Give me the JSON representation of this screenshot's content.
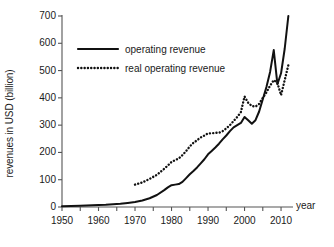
{
  "chart_data": {
    "type": "line",
    "title": "",
    "xlabel": "year",
    "ylabel": "revenues in USD (billion)",
    "xlim": [
      1950,
      2013
    ],
    "ylim": [
      0,
      700
    ],
    "grid": false,
    "legend_position": "upper-left-inside",
    "y_ticks": [
      0,
      100,
      200,
      300,
      400,
      500,
      600,
      700
    ],
    "x_ticks": [
      1950,
      1960,
      1970,
      1980,
      1990,
      2000,
      2010
    ],
    "x_minor_tick_step": 5,
    "y_tick_labels": [
      "0",
      "100",
      "200",
      "300",
      "400",
      "500",
      "600",
      "700"
    ],
    "x_tick_labels": [
      "1950",
      "1960",
      "1970",
      "1980",
      "1990",
      "2000",
      "2010"
    ],
    "series": [
      {
        "name": "operating revenue",
        "style": "solid",
        "color": "#111111",
        "x": [
          1950,
          1955,
          1960,
          1962,
          1964,
          1966,
          1968,
          1970,
          1972,
          1974,
          1976,
          1978,
          1979,
          1980,
          1981,
          1982,
          1983,
          1984,
          1985,
          1986,
          1987,
          1988,
          1989,
          1990,
          1991,
          1992,
          1993,
          1994,
          1995,
          1996,
          1997,
          1998,
          1999,
          2000,
          2001,
          2002,
          2003,
          2004,
          2005,
          2006,
          2007,
          2008,
          2009,
          2010,
          2011,
          2012
        ],
        "y": [
          3,
          5,
          7,
          8,
          10,
          12,
          15,
          18,
          24,
          32,
          44,
          62,
          72,
          80,
          82,
          84,
          92,
          106,
          120,
          132,
          145,
          160,
          175,
          193,
          205,
          218,
          232,
          248,
          262,
          278,
          292,
          300,
          308,
          330,
          318,
          305,
          318,
          350,
          395,
          440,
          495,
          575,
          450,
          490,
          580,
          700
        ]
      },
      {
        "name": "real operating revenue",
        "style": "dotted",
        "color": "#111111",
        "x": [
          1970,
          1972,
          1974,
          1976,
          1978,
          1979,
          1980,
          1981,
          1982,
          1983,
          1984,
          1985,
          1986,
          1987,
          1988,
          1989,
          1990,
          1991,
          1992,
          1993,
          1994,
          1995,
          1996,
          1997,
          1998,
          1999,
          2000,
          2001,
          2002,
          2003,
          2004,
          2005,
          2006,
          2007,
          2008,
          2009,
          2010,
          2011,
          2012
        ],
        "y": [
          82,
          90,
          103,
          118,
          140,
          152,
          165,
          172,
          178,
          190,
          205,
          222,
          235,
          245,
          255,
          262,
          270,
          270,
          272,
          272,
          278,
          288,
          300,
          315,
          330,
          348,
          405,
          382,
          370,
          368,
          378,
          400,
          420,
          445,
          465,
          455,
          410,
          465,
          520
        ]
      }
    ],
    "legend": [
      {
        "label": "operating revenue",
        "style": "solid"
      },
      {
        "label": "real operating revenue",
        "style": "dotted"
      }
    ]
  },
  "axes": {
    "y_title": "revenues in USD (billion)",
    "x_title": "year"
  }
}
